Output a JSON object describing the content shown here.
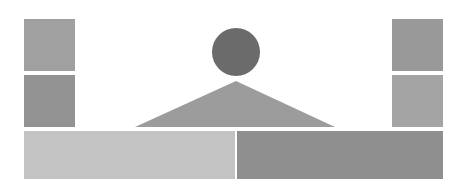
{
  "diagram": {
    "canvas": {
      "width": 467,
      "height": 188,
      "background": "#ffffff"
    },
    "shapes": {
      "left_top_square": {
        "x": 24,
        "y": 19,
        "w": 51,
        "h": 52,
        "color": "#a0a0a0"
      },
      "left_bottom_square": {
        "x": 24,
        "y": 75,
        "w": 51,
        "h": 52,
        "color": "#939393"
      },
      "right_top_square": {
        "x": 392,
        "y": 19,
        "w": 51,
        "h": 52,
        "color": "#999999"
      },
      "right_bottom_square": {
        "x": 392,
        "y": 75,
        "w": 51,
        "h": 52,
        "color": "#a4a4a4"
      },
      "circle": {
        "cx": 236,
        "cy": 52,
        "r": 24,
        "color": "#6b6b6b"
      },
      "triangle": {
        "points": "236,81 135,127 335,127",
        "color": "#9c9c9c"
      },
      "bottom_left_bar": {
        "x": 24,
        "y": 131,
        "w": 211,
        "h": 48,
        "color": "#c3c3c3"
      },
      "bottom_right_bar": {
        "x": 237,
        "y": 131,
        "w": 206,
        "h": 48,
        "color": "#8f8f8f"
      }
    }
  }
}
